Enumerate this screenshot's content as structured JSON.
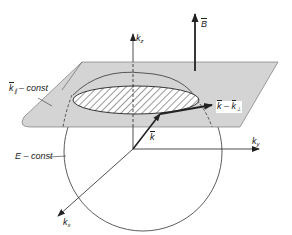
{
  "diagram": {
    "labels": {
      "kz": {
        "base": "k",
        "sub": "z"
      },
      "ky": {
        "base": "k",
        "sub": "y"
      },
      "kx": {
        "base": "k",
        "sub": "x"
      },
      "B": "B",
      "k": "k",
      "k_parallel_const": {
        "base": "k",
        "sub": "∥",
        "rest": " – const"
      },
      "k_minus_kperp": {
        "a": "k",
        "op": " – ",
        "b": "k",
        "sub": "⊥"
      },
      "E_const": "E – const"
    },
    "colors": {
      "plane_fill": "#d4d4d4",
      "line": "#222222",
      "hatch": "#444444",
      "background": "#ffffff"
    }
  }
}
